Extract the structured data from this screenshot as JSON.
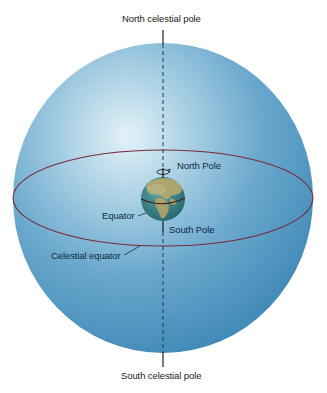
{
  "diagram": {
    "labels": {
      "north_celestial_pole": "North celestial pole",
      "south_celestial_pole": "South celestial pole",
      "north_pole": "North Pole",
      "south_pole": "South Pole",
      "equator": "Equator",
      "celestial_equator": "Celestial equator"
    },
    "icons": {
      "rotation_arrow": "rotation-arrow-icon"
    },
    "colors": {
      "celestial_sphere": "#4a92bd",
      "sphere_highlight": "#d6ecf6",
      "celestial_equator_line": "#7a2a3a",
      "earth_ocean": "#3e8a8a",
      "earth_land": "#b9a86a",
      "axis_line": "#222222"
    }
  }
}
